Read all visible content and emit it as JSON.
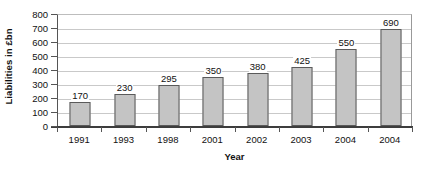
{
  "chart_data": {
    "type": "bar",
    "title": "",
    "subtitle": "",
    "xlabel": "Year",
    "ylabel": "Liabilities in £bn",
    "categories": [
      "1991",
      "1993",
      "1998",
      "2001",
      "2002",
      "2003",
      "2004",
      "2004"
    ],
    "values": [
      170,
      230,
      295,
      350,
      380,
      425,
      550,
      690
    ],
    "data_labels": [
      "170",
      "230",
      "295",
      "350",
      "380",
      "425",
      "550",
      "690"
    ],
    "ylim": [
      0,
      800
    ],
    "ytick_values": [
      0,
      100,
      200,
      300,
      400,
      500,
      600,
      700,
      800
    ],
    "ytick_labels": [
      "0",
      "100",
      "200",
      "300",
      "400",
      "500",
      "600",
      "700",
      "800"
    ],
    "grid": true,
    "grid_axis": "y",
    "legend": false,
    "legend_position": "none",
    "series": [
      {
        "name": "Liabilities",
        "values": [
          170,
          230,
          295,
          350,
          380,
          425,
          550,
          690
        ]
      }
    ],
    "colors": {
      "bar_fill": "#c4c4c4",
      "bar_border": "#5a5a5a",
      "gridline": "#c9c9c9",
      "axis": "#3d3d3d",
      "text": "#111111",
      "background": "#ffffff"
    }
  }
}
